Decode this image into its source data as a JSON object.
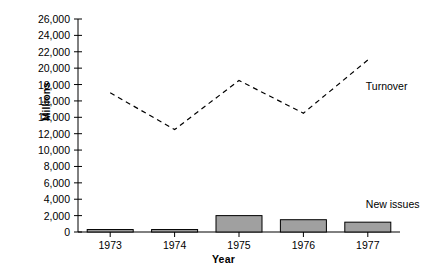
{
  "chart_data": {
    "type": "bar",
    "title": "",
    "subtitle": "",
    "xlabel": "Year",
    "ylabel": "Millions",
    "categories": [
      "1973",
      "1974",
      "1975",
      "1976",
      "1977"
    ],
    "ylim": [
      0,
      26000
    ],
    "ytick_labels": [
      "26,000",
      "24,000",
      "22,000",
      "20,000",
      "18,000",
      "16,000",
      "14,000",
      "12,000",
      "10,000",
      "8,000",
      "6,000",
      "4,000",
      "2,000",
      "0"
    ],
    "ytick_values": [
      26000,
      24000,
      22000,
      20000,
      18000,
      16000,
      14000,
      12000,
      10000,
      8000,
      6000,
      4000,
      2000,
      0
    ],
    "ytick_step": 2000,
    "grid": false,
    "legend_position": "inline-right",
    "series": [
      {
        "name": "New issues",
        "type": "bar",
        "color": "#a0a0a0",
        "edge_color": "#000000",
        "values": [
          300,
          300,
          2000,
          1500,
          1200
        ]
      },
      {
        "name": "Turnover",
        "type": "line",
        "style": "dashed",
        "color": "#000000",
        "values": [
          17000,
          12500,
          18500,
          14500,
          21000
        ]
      }
    ],
    "annotations": [
      {
        "text": "Turnover",
        "x": "1977",
        "y": 21000,
        "placement": "right"
      },
      {
        "text": "New issues",
        "x": "1977",
        "y": 4000,
        "placement": "right"
      }
    ]
  },
  "axis": {
    "y_title": "Millions",
    "x_title": "Year"
  }
}
